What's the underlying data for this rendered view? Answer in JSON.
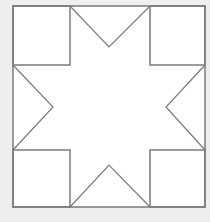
{
  "diagram": {
    "type": "quilt-block-eight-point-star",
    "colors": {
      "background": "#efefef",
      "fill": "#ffffff",
      "stroke": "#7a7a7a"
    },
    "outer_square": {
      "x": 13,
      "y": 6,
      "width": 192,
      "height": 201
    },
    "corner_squares": [
      {
        "name": "top-left",
        "x": 13,
        "y": 6,
        "width": 57,
        "height": 59
      },
      {
        "name": "top-right",
        "x": 150,
        "y": 6,
        "width": 55,
        "height": 59
      },
      {
        "name": "bottom-left",
        "x": 13,
        "y": 150,
        "width": 57,
        "height": 57
      },
      {
        "name": "bottom-right",
        "x": 150,
        "y": 150,
        "width": 55,
        "height": 57
      }
    ],
    "notches": {
      "top": [
        109,
        47
      ],
      "left": [
        53,
        107
      ],
      "right": [
        166,
        107
      ],
      "bottom": [
        109,
        165
      ]
    }
  }
}
